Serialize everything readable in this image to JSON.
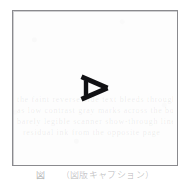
{
  "page": {
    "background_color": "#ffffff",
    "paper_color": "#fdfdfd"
  },
  "figure": {
    "frame": {
      "border_color": "#8a8a8e",
      "fill_color": "#fdfdfd",
      "x": 12,
      "y": 10,
      "width": 166,
      "height": 156
    },
    "glyph": {
      "name": "letter-a-rotated",
      "character": "A",
      "rotation_degrees": 90,
      "appearance": "right-pointing triangle outline with left vertical crossbar",
      "color": "#111114",
      "stroke_width": 5,
      "x": 84,
      "y": 74,
      "width": 28,
      "height": 27
    },
    "ghost_text": {
      "line1": "the faint reverse-side text bleeds through",
      "line2": "as low contrast gray marks across the box",
      "line3": "barely legible scanner show-through lines",
      "line4": "residual ink from the opposite page"
    }
  },
  "caption": {
    "label": "図",
    "text": "（図版キャプション）",
    "clipped": "true"
  }
}
